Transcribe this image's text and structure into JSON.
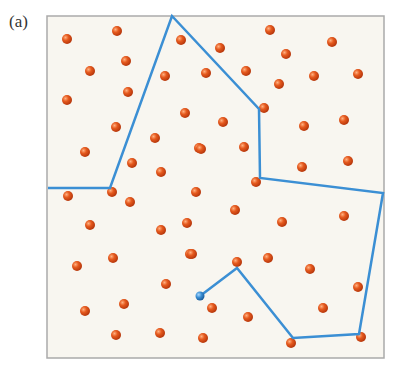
{
  "figure": {
    "panel_label": "(a)",
    "box": {
      "x": 47,
      "y": 16,
      "width": 337,
      "height": 342,
      "fill": "#f8f6f0",
      "stroke": "#aaaaaa"
    },
    "particle_color": "#e0551e",
    "path_color": "#3b8fd4",
    "particles": [
      [
        67,
        39
      ],
      [
        117,
        31
      ],
      [
        126,
        61
      ],
      [
        90,
        71
      ],
      [
        67,
        100
      ],
      [
        128,
        92
      ],
      [
        116,
        127
      ],
      [
        155,
        138
      ],
      [
        85,
        152
      ],
      [
        132,
        163
      ],
      [
        161,
        172
      ],
      [
        181,
        40
      ],
      [
        165,
        76
      ],
      [
        185,
        113
      ],
      [
        199,
        148
      ],
      [
        270,
        30
      ],
      [
        332,
        42
      ],
      [
        220,
        48
      ],
      [
        286,
        54
      ],
      [
        206,
        73
      ],
      [
        246,
        71
      ],
      [
        314,
        76
      ],
      [
        358,
        74
      ],
      [
        279,
        84
      ],
      [
        264,
        108
      ],
      [
        223,
        122
      ],
      [
        304,
        126
      ],
      [
        344,
        120
      ],
      [
        201,
        149
      ],
      [
        244,
        147
      ],
      [
        302,
        167
      ],
      [
        348,
        161
      ],
      [
        256,
        182
      ],
      [
        68,
        196
      ],
      [
        112,
        192
      ],
      [
        130,
        202
      ],
      [
        90,
        225
      ],
      [
        161,
        230
      ],
      [
        187,
        223
      ],
      [
        113,
        258
      ],
      [
        77,
        266
      ],
      [
        190,
        254
      ],
      [
        166,
        284
      ],
      [
        124,
        304
      ],
      [
        85,
        311
      ],
      [
        116,
        335
      ],
      [
        160,
        333
      ],
      [
        196,
        192
      ],
      [
        235,
        210
      ],
      [
        282,
        222
      ],
      [
        344,
        216
      ],
      [
        192,
        254
      ],
      [
        237,
        262
      ],
      [
        268,
        258
      ],
      [
        310,
        269
      ],
      [
        358,
        287
      ],
      [
        212,
        308
      ],
      [
        248,
        317
      ],
      [
        323,
        308
      ],
      [
        203,
        338
      ],
      [
        291,
        343
      ],
      [
        361,
        337
      ]
    ],
    "path": [
      [
        48,
        188
      ],
      [
        110,
        188
      ],
      [
        172,
        16
      ],
      [
        259,
        109
      ],
      [
        260,
        178
      ],
      [
        383,
        193
      ],
      [
        359,
        334
      ],
      [
        293,
        338
      ],
      [
        237,
        268
      ],
      [
        200,
        296
      ]
    ],
    "path_end": [
      200,
      296
    ]
  }
}
